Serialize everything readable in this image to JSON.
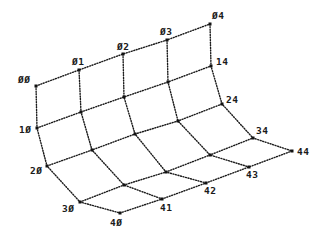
{
  "diagram": {
    "type": "surface-mesh",
    "line_color": "#1a1a1a",
    "nodes": {
      "00": [
        36,
        86
      ],
      "01": [
        79,
        70
      ],
      "02": [
        123,
        54
      ],
      "03": [
        167,
        40
      ],
      "04": [
        210,
        24
      ],
      "10": [
        37,
        128
      ],
      "11": [
        81,
        112
      ],
      "12": [
        124,
        97
      ],
      "13": [
        168,
        82
      ],
      "14": [
        211,
        66
      ],
      "20": [
        47,
        166
      ],
      "21": [
        92,
        150
      ],
      "22": [
        135,
        134
      ],
      "23": [
        178,
        121
      ],
      "24": [
        222,
        104
      ],
      "30": [
        80,
        202
      ],
      "31": [
        124,
        185
      ],
      "32": [
        166,
        172
      ],
      "33": [
        210,
        155
      ],
      "34": [
        253,
        138
      ],
      "40": [
        120,
        213
      ],
      "41": [
        162,
        199
      ],
      "42": [
        206,
        183
      ],
      "43": [
        249,
        167
      ],
      "44": [
        292,
        151
      ]
    },
    "labels": [
      {
        "id": "00",
        "text": "ØØ",
        "x": 18,
        "y": 83
      },
      {
        "id": "01",
        "text": "Ø1",
        "x": 72,
        "y": 65
      },
      {
        "id": "02",
        "text": "Ø2",
        "x": 117,
        "y": 50
      },
      {
        "id": "03",
        "text": "Ø3",
        "x": 160,
        "y": 35
      },
      {
        "id": "04",
        "text": "Ø4",
        "x": 212,
        "y": 19
      },
      {
        "id": "14",
        "text": "14",
        "x": 216,
        "y": 65
      },
      {
        "id": "24",
        "text": "24",
        "x": 226,
        "y": 103
      },
      {
        "id": "10",
        "text": "1Ø",
        "x": 19,
        "y": 133
      },
      {
        "id": "20",
        "text": "2Ø",
        "x": 30,
        "y": 174
      },
      {
        "id": "30",
        "text": "3Ø",
        "x": 62,
        "y": 212
      },
      {
        "id": "40",
        "text": "4Ø",
        "x": 110,
        "y": 226
      },
      {
        "id": "41",
        "text": "41",
        "x": 160,
        "y": 211
      },
      {
        "id": "42",
        "text": "42",
        "x": 204,
        "y": 194
      },
      {
        "id": "43",
        "text": "43",
        "x": 246,
        "y": 178
      },
      {
        "id": "34",
        "text": "34",
        "x": 256,
        "y": 134
      },
      {
        "id": "44",
        "text": "44",
        "x": 297,
        "y": 155
      }
    ]
  }
}
